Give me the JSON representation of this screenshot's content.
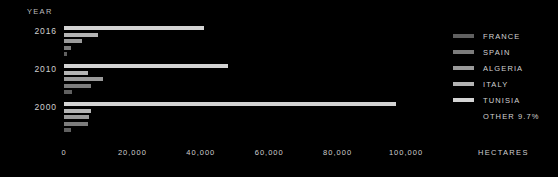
{
  "chart_data": {
    "type": "bar",
    "orientation": "horizontal",
    "title": "",
    "xlabel": "HECTARES",
    "ylabel": "YEAR",
    "xlim": [
      0,
      100000
    ],
    "grid": false,
    "legend_position": "right",
    "categories": [
      "2016",
      "2010",
      "2000"
    ],
    "xticks": [
      {
        "value": 0,
        "label": "0"
      },
      {
        "value": 20000,
        "label": "20,000"
      },
      {
        "value": 40000,
        "label": "40,000"
      },
      {
        "value": 60000,
        "label": "60,000"
      },
      {
        "value": 80000,
        "label": "80,000"
      },
      {
        "value": 100000,
        "label": "100,000"
      }
    ],
    "series": [
      {
        "name": "TUNISIA",
        "color": "#d4d4d4",
        "values": [
          41000,
          48000,
          97000
        ]
      },
      {
        "name": "ITALY",
        "color": "#b4b4b4",
        "values": [
          9800,
          6900,
          7900
        ]
      },
      {
        "name": "ALGERIA",
        "color": "#9a9a9a",
        "values": [
          5200,
          11500,
          7400
        ]
      },
      {
        "name": "SPAIN",
        "color": "#7c7c7c",
        "values": [
          2100,
          7900,
          7100
        ]
      },
      {
        "name": "FRANCE",
        "color": "#606060",
        "values": [
          800,
          2400,
          2000
        ]
      }
    ],
    "annotations": [
      "OTHER 9.7%"
    ]
  },
  "axes": {
    "year_axis_title": "YEAR",
    "hectares_label": "HECTARES"
  },
  "legend": {
    "items": [
      {
        "label": "FRANCE",
        "color": "#606060"
      },
      {
        "label": "SPAIN",
        "color": "#7c7c7c"
      },
      {
        "label": "ALGERIA",
        "color": "#9a9a9a"
      },
      {
        "label": "ITALY",
        "color": "#b4b4b4"
      },
      {
        "label": "TUNISIA",
        "color": "#d4d4d4"
      }
    ],
    "note": "OTHER 9.7%"
  },
  "theme": {
    "background": "#000000",
    "text": "#cfcfcf"
  }
}
